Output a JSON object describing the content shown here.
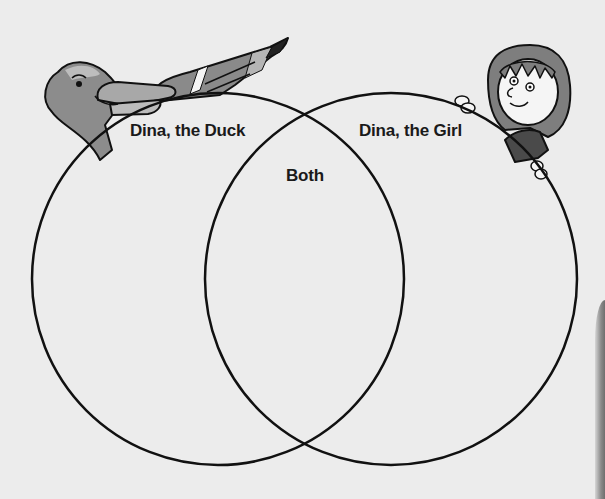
{
  "diagram": {
    "type": "venn",
    "background_color": "#ececec",
    "stroke_color": "#111111",
    "sets": [
      {
        "id": "duck",
        "label": "Dina, the Duck",
        "center": [
          218,
          279
        ],
        "radius": 186
      },
      {
        "id": "girl",
        "label": "Dina, the Girl",
        "center": [
          391,
          279
        ],
        "radius": 186
      }
    ],
    "intersection": {
      "label": "Both"
    },
    "illustrations": [
      {
        "name": "duck",
        "description": "cartoon duck head and wing peeking over left circle"
      },
      {
        "name": "girl",
        "description": "cartoon girl peeking over right circle, hands on the edge"
      }
    ]
  },
  "labels": {
    "duck": "Dina, the Duck",
    "girl": "Dina, the Girl",
    "both": "Both"
  }
}
